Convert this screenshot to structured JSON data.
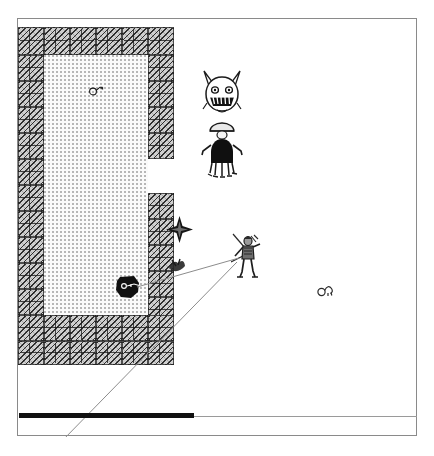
{
  "app": {
    "title": "Dungeon Map View",
    "screen_width": 434,
    "screen_height": 456
  },
  "frame": {
    "name": "game-viewport",
    "x": 17,
    "y": 18,
    "width": 400,
    "height": 418,
    "border_color": "#8a8a8a"
  },
  "map": {
    "tile_size": 26,
    "wall_color": "#cfcfcf",
    "wall_hatch_color": "#141414",
    "floor_color": "#fbfbfb",
    "floor_stipple_color": "#3c3c3c",
    "room": {
      "label": "stone chamber",
      "floor": {
        "x": 26,
        "y": 36,
        "width": 104,
        "height": 260
      }
    },
    "walls": [
      {
        "x": 0,
        "y": 8,
        "width": 26,
        "height": 28
      },
      {
        "x": 26,
        "y": 8,
        "width": 26,
        "height": 28
      },
      {
        "x": 52,
        "y": 8,
        "width": 26,
        "height": 28
      },
      {
        "x": 78,
        "y": 8,
        "width": 26,
        "height": 28
      },
      {
        "x": 104,
        "y": 8,
        "width": 26,
        "height": 28
      },
      {
        "x": 130,
        "y": 8,
        "width": 26,
        "height": 28
      },
      {
        "x": 0,
        "y": 36,
        "width": 26,
        "height": 26
      },
      {
        "x": 0,
        "y": 62,
        "width": 26,
        "height": 26
      },
      {
        "x": 0,
        "y": 88,
        "width": 26,
        "height": 26
      },
      {
        "x": 0,
        "y": 114,
        "width": 26,
        "height": 26
      },
      {
        "x": 0,
        "y": 140,
        "width": 26,
        "height": 26
      },
      {
        "x": 0,
        "y": 166,
        "width": 26,
        "height": 26
      },
      {
        "x": 0,
        "y": 192,
        "width": 26,
        "height": 26
      },
      {
        "x": 0,
        "y": 218,
        "width": 26,
        "height": 26
      },
      {
        "x": 0,
        "y": 244,
        "width": 26,
        "height": 26
      },
      {
        "x": 0,
        "y": 270,
        "width": 26,
        "height": 26
      },
      {
        "x": 130,
        "y": 36,
        "width": 26,
        "height": 26
      },
      {
        "x": 130,
        "y": 62,
        "width": 26,
        "height": 26
      },
      {
        "x": 130,
        "y": 88,
        "width": 26,
        "height": 26
      },
      {
        "x": 130,
        "y": 114,
        "width": 26,
        "height": 26
      },
      {
        "x": 130,
        "y": 174,
        "width": 26,
        "height": 26
      },
      {
        "x": 130,
        "y": 200,
        "width": 26,
        "height": 26
      },
      {
        "x": 130,
        "y": 226,
        "width": 26,
        "height": 26
      },
      {
        "x": 130,
        "y": 252,
        "width": 26,
        "height": 26
      },
      {
        "x": 130,
        "y": 278,
        "width": 26,
        "height": 26
      },
      {
        "x": 0,
        "y": 296,
        "width": 26,
        "height": 26
      },
      {
        "x": 26,
        "y": 296,
        "width": 26,
        "height": 26
      },
      {
        "x": 52,
        "y": 296,
        "width": 26,
        "height": 26
      },
      {
        "x": 78,
        "y": 296,
        "width": 26,
        "height": 26
      },
      {
        "x": 104,
        "y": 296,
        "width": 26,
        "height": 26
      },
      {
        "x": 130,
        "y": 296,
        "width": 26,
        "height": 26
      },
      {
        "x": 0,
        "y": 322,
        "width": 26,
        "height": 24
      },
      {
        "x": 26,
        "y": 322,
        "width": 26,
        "height": 24
      },
      {
        "x": 52,
        "y": 322,
        "width": 26,
        "height": 24
      },
      {
        "x": 78,
        "y": 322,
        "width": 26,
        "height": 24
      },
      {
        "x": 104,
        "y": 322,
        "width": 26,
        "height": 24
      },
      {
        "x": 130,
        "y": 322,
        "width": 26,
        "height": 24
      }
    ]
  },
  "entities": [
    {
      "id": "monster-head",
      "label": "grinning imp",
      "icon": "imp-face-icon",
      "x": 183,
      "y": 50,
      "width": 42,
      "height": 50
    },
    {
      "id": "cloaked-figure",
      "label": "cloaked wraith",
      "icon": "wraith-icon",
      "x": 183,
      "y": 102,
      "width": 42,
      "height": 58
    },
    {
      "id": "player",
      "label": "adventurer",
      "icon": "adventurer-icon",
      "x": 213,
      "y": 213,
      "width": 34,
      "height": 47
    }
  ],
  "items": [
    {
      "id": "item-room-top",
      "label": "small item",
      "icon": "keyring-icon",
      "x": 71,
      "y": 64,
      "width": 16,
      "height": 14
    },
    {
      "id": "boulder",
      "label": "dark boulder",
      "icon": "boulder-icon",
      "x": 97,
      "y": 255,
      "width": 25,
      "height": 25
    },
    {
      "id": "wall-burst",
      "label": "rubble burst",
      "icon": "burst-icon",
      "x": 147,
      "y": 196,
      "width": 29,
      "height": 29
    },
    {
      "id": "wall-mark",
      "label": "wall scuff",
      "icon": "scuff-icon",
      "x": 148,
      "y": 235,
      "width": 22,
      "height": 22
    },
    {
      "id": "item-field",
      "label": "small item",
      "icon": "keyring-icon",
      "x": 299,
      "y": 263,
      "width": 18,
      "height": 16
    }
  ],
  "sight_lines": [
    {
      "id": "los-player-to-boulder",
      "label": "line of sight to boulder",
      "x1": 221,
      "y1": 239,
      "x2": 119,
      "y2": 268
    },
    {
      "id": "los-player-to-status",
      "label": "trajectory to status bar",
      "x1": 219,
      "y1": 243,
      "x2": 44,
      "y2": 422
    }
  ],
  "status_bar": {
    "label": "health bar",
    "filled_width": 175,
    "track_width": 398,
    "fill_color": "#111111",
    "track_color": "#9a9a9a"
  }
}
